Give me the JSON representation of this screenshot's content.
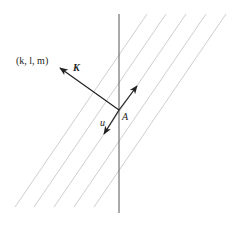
{
  "diagram": {
    "type": "wave-plane geometry",
    "labels": {
      "direction": "(k, l, m)",
      "wave_vector": "K",
      "displacement": "u",
      "point": "A"
    },
    "colors": {
      "stroke": "#222222",
      "hatch": "#c8c8c8",
      "axis": "#555555",
      "background": "#ffffff"
    },
    "elements": {
      "vertical_line": {
        "x": 119,
        "y1": 14,
        "y2": 213
      },
      "hatch_lines": [
        {
          "x1": 147,
          "y1": 14,
          "x2": 15,
          "y2": 207
        },
        {
          "x1": 166,
          "y1": 14,
          "x2": 34,
          "y2": 207
        },
        {
          "x1": 186,
          "y1": 14,
          "x2": 54,
          "y2": 207
        },
        {
          "x1": 206,
          "y1": 14,
          "x2": 74,
          "y2": 207
        },
        {
          "x1": 226,
          "y1": 14,
          "x2": 94,
          "y2": 207
        }
      ],
      "point_A": {
        "x": 119,
        "y": 110
      },
      "arrow_K": {
        "from": [
          119,
          110
        ],
        "to": [
          60,
          68
        ]
      },
      "arrow_up": {
        "from": [
          119,
          110
        ],
        "to": [
          137,
          86
        ]
      },
      "arrow_u": {
        "from": [
          119,
          110
        ],
        "to": [
          104,
          134
        ]
      }
    }
  }
}
